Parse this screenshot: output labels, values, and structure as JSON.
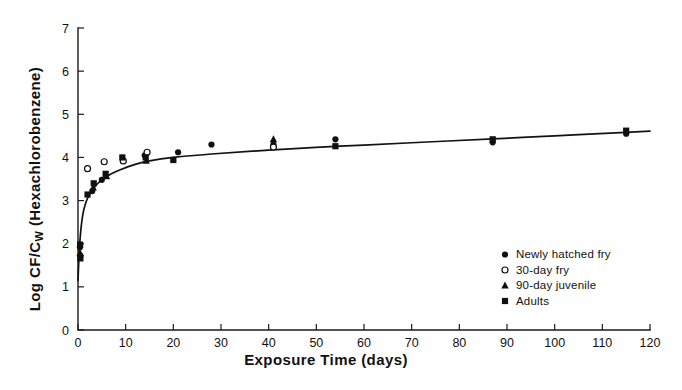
{
  "chart_data": {
    "type": "scatter",
    "title": "",
    "xlabel": "Exposure Time (days)",
    "ylabel_main": "Log CF/C",
    "ylabel_sub": "W",
    "ylabel_tail": " (Hexachlorobenzene)",
    "ylabel_full": "Log CF/Cw (Hexachlorobenzene)",
    "xlim": [
      0,
      120
    ],
    "ylim": [
      0,
      7
    ],
    "xticks": [
      0,
      10,
      20,
      30,
      40,
      50,
      60,
      70,
      80,
      90,
      100,
      110,
      120
    ],
    "yticks": [
      0,
      1,
      2,
      3,
      4,
      5,
      6,
      7
    ],
    "xtick_labels": [
      "0",
      "10",
      "20",
      "30",
      "40",
      "50",
      "60",
      "70",
      "80",
      "90",
      "100",
      "110",
      "120"
    ],
    "ytick_labels": [
      "0",
      "1",
      "2",
      "3",
      "4",
      "5",
      "6",
      "7"
    ],
    "grid": false,
    "legend_position": "bottom-right",
    "curve_color": "#121212",
    "marker_color": "#101010",
    "fit_curve": [
      {
        "x": 0.0,
        "y": 1.15
      },
      {
        "x": 0.25,
        "y": 1.8
      },
      {
        "x": 0.5,
        "y": 2.2
      },
      {
        "x": 0.8,
        "y": 2.52
      },
      {
        "x": 1.2,
        "y": 2.78
      },
      {
        "x": 1.8,
        "y": 3.0
      },
      {
        "x": 2.5,
        "y": 3.16
      },
      {
        "x": 3.5,
        "y": 3.32
      },
      {
        "x": 5.0,
        "y": 3.48
      },
      {
        "x": 7.0,
        "y": 3.62
      },
      {
        "x": 9.0,
        "y": 3.72
      },
      {
        "x": 12.0,
        "y": 3.84
      },
      {
        "x": 15.0,
        "y": 3.92
      },
      {
        "x": 20.0,
        "y": 4.0
      },
      {
        "x": 28.0,
        "y": 4.08
      },
      {
        "x": 40.0,
        "y": 4.17
      },
      {
        "x": 55.0,
        "y": 4.26
      },
      {
        "x": 70.0,
        "y": 4.34
      },
      {
        "x": 87.0,
        "y": 4.43
      },
      {
        "x": 100.0,
        "y": 4.5
      },
      {
        "x": 115.0,
        "y": 4.58
      },
      {
        "x": 120.0,
        "y": 4.61
      }
    ],
    "series": [
      {
        "name": "Newly hatched fry",
        "marker": "filled-circle",
        "points": [
          {
            "x": 0.4,
            "y": 1.92
          },
          {
            "x": 0.5,
            "y": 1.72
          },
          {
            "x": 3.0,
            "y": 3.22
          },
          {
            "x": 5.0,
            "y": 3.48
          },
          {
            "x": 14.0,
            "y": 4.05
          },
          {
            "x": 21.0,
            "y": 4.12
          },
          {
            "x": 28.0,
            "y": 4.3
          },
          {
            "x": 41.0,
            "y": 4.3
          },
          {
            "x": 54.0,
            "y": 4.42
          },
          {
            "x": 87.0,
            "y": 4.35
          },
          {
            "x": 115.0,
            "y": 4.55
          }
        ]
      },
      {
        "name": "30-day fry",
        "marker": "open-circle",
        "points": [
          {
            "x": 2.0,
            "y": 3.74
          },
          {
            "x": 5.5,
            "y": 3.9
          },
          {
            "x": 9.5,
            "y": 3.92
          },
          {
            "x": 14.5,
            "y": 4.12
          },
          {
            "x": 41.0,
            "y": 4.24
          }
        ]
      },
      {
        "name": "90-day juvenile",
        "marker": "filled-triangle",
        "points": [
          {
            "x": 0.45,
            "y": 1.78
          },
          {
            "x": 3.2,
            "y": 3.3
          },
          {
            "x": 6.0,
            "y": 3.56
          },
          {
            "x": 14.3,
            "y": 3.92
          },
          {
            "x": 41.0,
            "y": 4.42
          }
        ]
      },
      {
        "name": "Adults",
        "marker": "filled-square",
        "points": [
          {
            "x": 0.45,
            "y": 1.98
          },
          {
            "x": 0.5,
            "y": 1.66
          },
          {
            "x": 2.0,
            "y": 3.14
          },
          {
            "x": 3.3,
            "y": 3.4
          },
          {
            "x": 5.8,
            "y": 3.62
          },
          {
            "x": 9.3,
            "y": 4.0
          },
          {
            "x": 14.2,
            "y": 4.0
          },
          {
            "x": 20.0,
            "y": 3.94
          },
          {
            "x": 54.0,
            "y": 4.26
          },
          {
            "x": 87.0,
            "y": 4.42
          },
          {
            "x": 115.0,
            "y": 4.62
          }
        ]
      }
    ],
    "legend": [
      {
        "label": "Newly hatched fry",
        "marker": "filled-circle"
      },
      {
        "label": "30-day fry",
        "marker": "open-circle"
      },
      {
        "label": "90-day juvenile",
        "marker": "filled-triangle"
      },
      {
        "label": "Adults",
        "marker": "filled-square"
      }
    ]
  }
}
